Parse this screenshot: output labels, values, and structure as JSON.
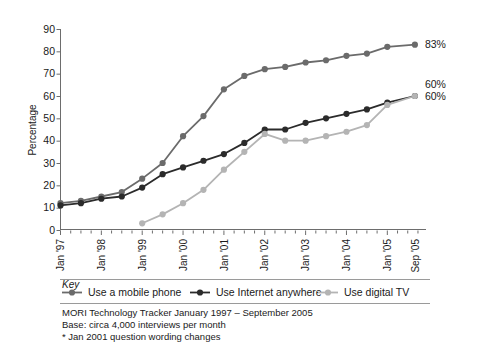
{
  "chart_data": {
    "type": "line",
    "title": "",
    "xlabel": "",
    "ylabel": "Percentage",
    "ylim": [
      0,
      90
    ],
    "ytick_labels": [
      "0",
      "10",
      "20",
      "30",
      "40",
      "50",
      "60",
      "70",
      "80",
      "90"
    ],
    "ytick_values": [
      0,
      10,
      20,
      30,
      40,
      50,
      60,
      70,
      80,
      90
    ],
    "grid": false,
    "legend_position": "below-axes",
    "legend_title": "Key",
    "x_major_labels": [
      "Jan '97",
      "Jan '98",
      "Jan '99",
      "Jan '00",
      "Jan '01",
      "Jan '02",
      "Jan '03",
      "Jan '04",
      "Jan '05",
      "Sep '05"
    ],
    "x_major_positions": [
      0,
      4,
      8,
      12,
      16,
      20,
      24,
      28,
      32,
      34.7
    ],
    "x_minor_ticks_per_year": 4,
    "x_axis_units": "quarters from Jan 1997",
    "series": [
      {
        "name": "Use a mobile phone",
        "color": "#6b6b6b",
        "x": [
          0,
          2,
          4,
          6,
          8,
          10,
          12,
          14,
          16,
          18,
          20,
          22,
          24,
          26,
          28,
          30,
          32,
          34.7
        ],
        "values": [
          12,
          13,
          15,
          17,
          23,
          30,
          42,
          51,
          63,
          69,
          72,
          73,
          75,
          76,
          78,
          79,
          82,
          83
        ],
        "end_label": "83%"
      },
      {
        "name": "Use Internet anywhere",
        "color": "#2b2b2b",
        "x": [
          0,
          2,
          4,
          6,
          8,
          10,
          12,
          14,
          16,
          18,
          20,
          22,
          24,
          26,
          28,
          30,
          32,
          34.7
        ],
        "values": [
          11,
          12,
          14,
          15,
          19,
          25,
          28,
          31,
          34,
          39,
          45,
          45,
          48,
          50,
          52,
          54,
          57,
          60
        ],
        "end_label": "60%"
      },
      {
        "name": "Use digital TV",
        "color": "#b4b4b4",
        "x": [
          8,
          10,
          12,
          14,
          16,
          18,
          20,
          22,
          24,
          26,
          28,
          30,
          32,
          34.7
        ],
        "values": [
          3,
          7,
          12,
          18,
          27,
          35,
          43,
          40,
          40,
          42,
          44,
          47,
          56,
          60
        ],
        "end_label": "60%"
      }
    ]
  },
  "end_labels": {
    "mobile": "83%",
    "internet": "60%",
    "digital_tv": "60%"
  },
  "axes": {
    "y_title": "Percentage"
  },
  "legend": {
    "title": "Key",
    "items": [
      {
        "label": "Use a mobile phone",
        "color": "#6b6b6b"
      },
      {
        "label": "Use Internet anywhere",
        "color": "#2b2b2b"
      },
      {
        "label": "Use digital TV",
        "color": "#b4b4b4"
      }
    ]
  },
  "footnotes": {
    "line1": "MORI Technology Tracker January 1997 – September 2005",
    "line2": "Base: circa 4,000 interviews per month",
    "line3": "* Jan 2001 question wording changes"
  }
}
